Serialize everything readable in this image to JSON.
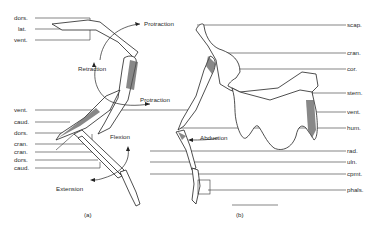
{
  "figure": {
    "panel_a": {
      "caption": "(a)",
      "left_labels": [
        "dors.",
        "lat.",
        "vent.",
        "vent.",
        "caud.",
        "dors.",
        "cran.",
        "cran.",
        "dors.",
        "caud."
      ],
      "movement_labels": {
        "protraction_top": "Protraction",
        "retraction": "Retraction",
        "protraction_mid": "Protraction",
        "flexion": "Flexion",
        "extension": "Extension"
      }
    },
    "panel_b": {
      "caption": "(b)",
      "right_labels": [
        "scap.",
        "cran.",
        "cor.",
        "stern.",
        "vent.",
        "hum.",
        "rad.",
        "uln.",
        "cpmt.",
        "phals."
      ],
      "movement_labels": {
        "abduction": "Abduction"
      },
      "scale_bar": ""
    }
  }
}
